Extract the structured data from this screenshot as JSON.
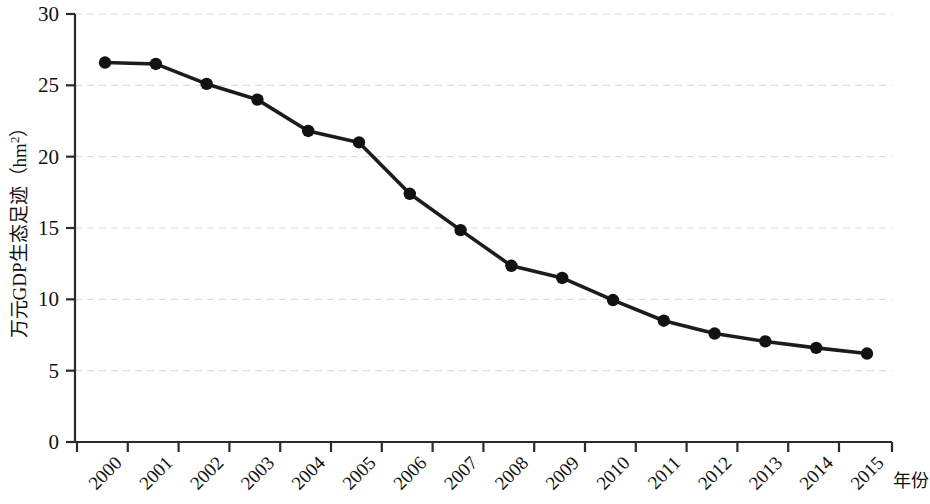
{
  "chart_data": {
    "type": "line",
    "title": "",
    "xlabel": "年份",
    "ylabel": "万元GDP生态足迹（hm²）",
    "ylabel_main": "万元GDP生态足迹（hm",
    "ylabel_sup": "2",
    "ylabel_tail": "）",
    "categories": [
      "2000",
      "2001",
      "2002",
      "2003",
      "2004",
      "2005",
      "2006",
      "2007",
      "2008",
      "2009",
      "2010",
      "2011",
      "2012",
      "2013",
      "2014",
      "2015"
    ],
    "values": [
      26.6,
      26.5,
      25.1,
      24.0,
      21.8,
      21.0,
      17.4,
      14.85,
      12.35,
      11.5,
      9.95,
      8.5,
      7.6,
      7.05,
      6.6,
      6.2
    ],
    "series": [
      {
        "name": "万元GDP生态足迹",
        "values": [
          26.6,
          26.5,
          25.1,
          24.0,
          21.8,
          21.0,
          17.4,
          14.85,
          12.35,
          11.5,
          9.95,
          8.5,
          7.6,
          7.05,
          6.6,
          6.2
        ]
      }
    ],
    "ylim": [
      0,
      30
    ],
    "yticks": [
      0,
      5,
      10,
      15,
      20,
      25,
      30
    ],
    "ytick_labels": [
      "0",
      "5",
      "10",
      "15",
      "20",
      "25",
      "30"
    ],
    "grid": "horizontal-dashed",
    "legend": "none",
    "marker": "filled-circle",
    "line_color": "#1c1c1c",
    "marker_color": "#121212",
    "grid_color": "#d8d8d8",
    "axis_color": "#2b2b2b",
    "xtick_rotation": -45
  }
}
